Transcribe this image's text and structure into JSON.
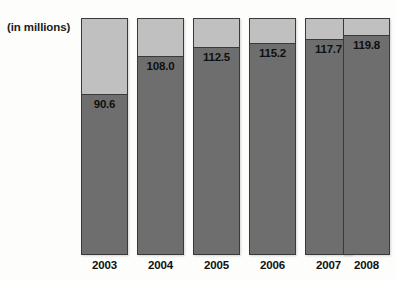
{
  "chart_data": {
    "type": "bar",
    "subtype": "stacked-column",
    "title": "",
    "note": "(in millions)",
    "xlabel": "",
    "ylabel": "",
    "categories": [
      "2003",
      "2004",
      "2005",
      "2006",
      "2007",
      "2008"
    ],
    "values": [
      90.6,
      108.0,
      112.5,
      115.2,
      117.7,
      119.8
    ],
    "value_labels": [
      "90.6",
      "108.0",
      "112.5",
      "115.2",
      "117.7",
      "119.8"
    ],
    "series": [
      {
        "name": "value",
        "color": "#6e6e6e",
        "values": [
          90.6,
          108.0,
          112.5,
          115.2,
          117.7,
          119.8
        ]
      },
      {
        "name": "remainder",
        "color": "#c0c0c0",
        "values": [
          35.4,
          18.0,
          13.5,
          10.8,
          8.3,
          6.2
        ]
      }
    ],
    "ylim": [
      0,
      126
    ],
    "grid": false,
    "legend": false
  },
  "chart": {
    "units_note": "(in millions)",
    "bars": [
      {
        "year": "2003",
        "value_label": "90.6",
        "fill_ratio": 0.675,
        "left": 81
      },
      {
        "year": "2004",
        "value_label": "108.0",
        "fill_ratio": 0.835,
        "left": 137
      },
      {
        "year": "2005",
        "value_label": "112.5",
        "fill_ratio": 0.873,
        "left": 193
      },
      {
        "year": "2006",
        "value_label": "115.2",
        "fill_ratio": 0.89,
        "left": 249
      },
      {
        "year": "2007",
        "value_label": "117.7",
        "fill_ratio": 0.907,
        "left": 305
      },
      {
        "year": "2008",
        "value_label": "119.8",
        "fill_ratio": 0.924,
        "left": 343
      }
    ]
  }
}
